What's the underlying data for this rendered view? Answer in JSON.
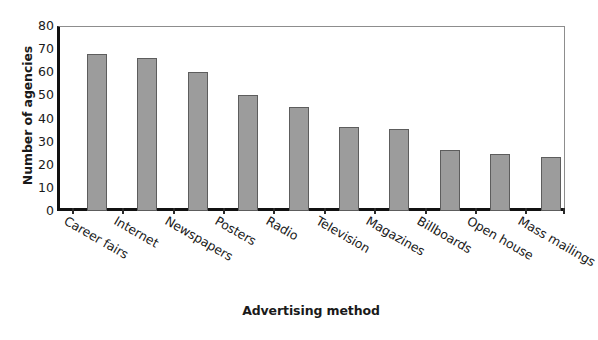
{
  "chart_data": {
    "type": "bar",
    "title": "",
    "xlabel": "Advertising method",
    "ylabel": "Number of agencies",
    "categories": [
      "Career fairs",
      "Internet",
      "Newspapers",
      "Posters",
      "Radio",
      "Television",
      "Magazines",
      "Billboards",
      "Open house",
      "Mass mailings"
    ],
    "values": [
      68,
      66,
      60,
      50,
      45,
      36.5,
      35.5,
      26.5,
      24.5,
      23.5
    ],
    "ylim": [
      0,
      80
    ],
    "ytick_labels": [
      "0",
      "10",
      "20",
      "30",
      "40",
      "50",
      "60",
      "70",
      "80"
    ],
    "ytick_values": [
      0,
      10,
      20,
      30,
      40,
      50,
      60,
      70,
      80
    ],
    "grid": false,
    "legend": false,
    "bar_color": "#9c9c9c",
    "bar_edge_color": "#5d5d5d",
    "axis_color": "#111111",
    "frame_color": "#8d8d8d",
    "background": "#ffffff",
    "xtick_label_rotation": 30
  }
}
